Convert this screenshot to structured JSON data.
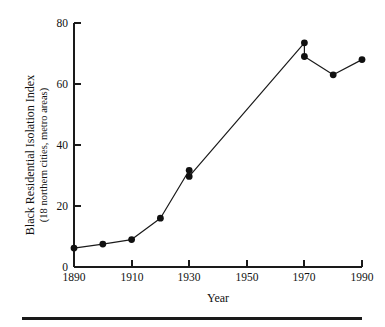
{
  "figure": {
    "background_color": "#ffffff",
    "ink_color": "#1a1a1a",
    "bottom_rule": "horizontal-rule"
  },
  "chart_data": {
    "type": "line",
    "title": "",
    "subtitle": "",
    "xlabel": "Year",
    "ylabel": "Black Residential Isolation Index",
    "ylabel_sub": "(18 northern cities, metro areas)",
    "xlim": [
      1890,
      1990
    ],
    "ylim": [
      0,
      80
    ],
    "xticks": [
      1890,
      1910,
      1930,
      1950,
      1970,
      1990
    ],
    "xtick_labels": [
      "1890",
      "1910",
      "1930",
      "1950",
      "1970",
      "1990"
    ],
    "yticks": [
      0,
      20,
      40,
      60,
      80
    ],
    "ytick_labels": [
      "0",
      "20",
      "40",
      "60",
      "80"
    ],
    "grid": false,
    "legend": false,
    "marker": "filled-circle",
    "x": [
      1890,
      1900,
      1910,
      1920,
      1930,
      1930,
      1970,
      1970,
      1980,
      1990
    ],
    "values": [
      6.2,
      7.5,
      9.0,
      16.0,
      31.7,
      29.7,
      73.5,
      69.0,
      63.0,
      68.0
    ],
    "points": [
      {
        "year": 1890,
        "value": 6.2
      },
      {
        "year": 1900,
        "value": 7.5
      },
      {
        "year": 1910,
        "value": 9.0
      },
      {
        "year": 1920,
        "value": 16.0
      },
      {
        "year": 1930,
        "value": 31.7
      },
      {
        "year": 1930,
        "value": 29.7
      },
      {
        "year": 1970,
        "value": 73.5
      },
      {
        "year": 1970,
        "value": 69.0
      },
      {
        "year": 1980,
        "value": 63.0
      },
      {
        "year": 1990,
        "value": 68.0
      }
    ]
  }
}
